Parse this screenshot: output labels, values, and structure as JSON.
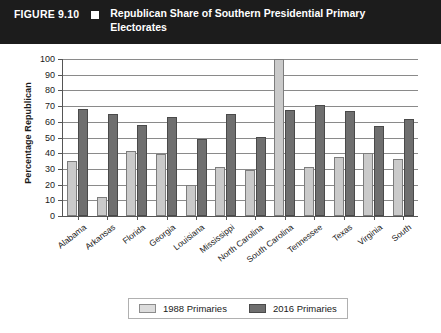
{
  "figure": {
    "label": "FIGURE 9.10",
    "marker_icon": "black-square-icon",
    "title": "Republican Share of Southern Presidential Primary Electorates"
  },
  "colors": {
    "header_background": "#1c1c1c",
    "header_text": "#ffffff",
    "series_1988": "#cacaca",
    "series_2016": "#6f6f6f",
    "axis": "#555555",
    "gridline": "#8a8a8a"
  },
  "legend": {
    "items": [
      {
        "label": "1988 Primaries",
        "swatch": "light-gray-swatch"
      },
      {
        "label": "2016 Primaries",
        "swatch": "dark-gray-swatch"
      }
    ]
  },
  "chart_data": {
    "type": "bar",
    "title": "Republican Share of Southern Presidential Primary Electorates",
    "xlabel": "",
    "ylabel": "Percentage Republican",
    "ylim": [
      0,
      100
    ],
    "yticks": [
      0,
      10,
      20,
      30,
      40,
      50,
      60,
      70,
      80,
      90,
      100
    ],
    "ytick_labels": [
      "0",
      "10",
      "20",
      "30",
      "40",
      "50",
      "60",
      "70",
      "80",
      "90",
      "100"
    ],
    "grid": true,
    "legend_position": "bottom-center",
    "categories": [
      "Alabama",
      "Arkansas",
      "Florida",
      "Georgia",
      "Louisiana",
      "Mississippi",
      "North Carolina",
      "South Carolina",
      "Tennessee",
      "Texas",
      "Virginia",
      "South"
    ],
    "series": [
      {
        "name": "1988 Primaries",
        "color": "#cacaca",
        "values": [
          35,
          12,
          41.5,
          39.5,
          19.5,
          31,
          29,
          100,
          31,
          37.5,
          40,
          36
        ]
      },
      {
        "name": "2016 Primaries",
        "color": "#6f6f6f",
        "values": [
          68,
          65,
          58,
          63,
          49,
          65,
          50.5,
          67.5,
          70.5,
          67,
          57.5,
          62
        ]
      }
    ]
  }
}
